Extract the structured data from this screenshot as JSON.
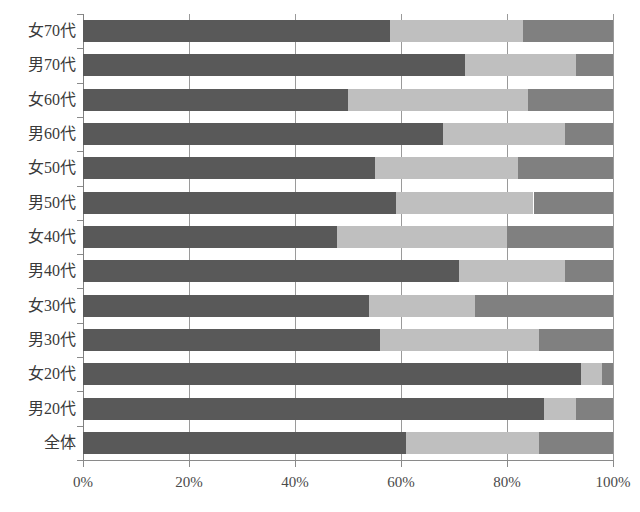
{
  "chart_data": {
    "type": "bar",
    "orientation": "horizontal",
    "stacked": true,
    "normalized": "percent",
    "title": "",
    "subtitle": "",
    "xlabel": "",
    "ylabel": "",
    "xlim": [
      0,
      100
    ],
    "grid": true,
    "legend": null,
    "xticks": [
      "0%",
      "20%",
      "40%",
      "60%",
      "80%",
      "100%"
    ],
    "xtick_values": [
      0,
      20,
      40,
      60,
      80,
      100
    ],
    "categories": [
      "女70代",
      "男70代",
      "女60代",
      "男60代",
      "女50代",
      "男50代",
      "女40代",
      "男40代",
      "女30代",
      "男30代",
      "女20代",
      "男20代",
      "全体"
    ],
    "series": [
      {
        "name": "series-1",
        "color": "#595959",
        "values": [
          58,
          72,
          50,
          68,
          55,
          59,
          48,
          71,
          54,
          56,
          94,
          87,
          61
        ]
      },
      {
        "name": "series-2",
        "color": "#bfbfbf",
        "values": [
          25,
          21,
          34,
          23,
          27,
          26,
          32,
          20,
          20,
          30,
          4,
          6,
          25
        ]
      },
      {
        "name": "series-3",
        "color": "#808080",
        "values": [
          17,
          7,
          16,
          9,
          18,
          15,
          20,
          9,
          26,
          14,
          2,
          7,
          14
        ]
      }
    ],
    "cumulative_boundaries": [
      [
        58,
        83
      ],
      [
        72,
        93
      ],
      [
        50,
        84
      ],
      [
        68,
        91
      ],
      [
        55,
        82
      ],
      [
        59,
        85
      ],
      [
        48,
        80
      ],
      [
        71,
        91
      ],
      [
        54,
        74
      ],
      [
        56,
        86
      ],
      [
        94,
        98
      ],
      [
        87,
        93
      ],
      [
        61,
        86
      ]
    ]
  },
  "colors": {
    "segment_dark": "#595959",
    "segment_light": "#bfbfbf",
    "segment_medium": "#808080",
    "axis": "#8a8a8a",
    "gridline": "#9a9a9a",
    "text": "#3a3a3a",
    "background": "#ffffff"
  }
}
